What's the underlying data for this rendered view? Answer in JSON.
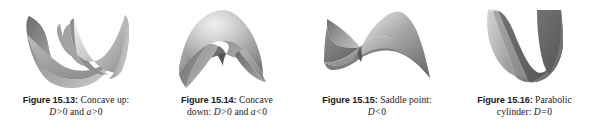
{
  "page": {
    "background_color": "#ffffff",
    "text_color": "#1c1a1b",
    "kind": "textbook-figure-strip",
    "figure_count": 4
  },
  "figures": [
    {
      "id": "figure-15-13",
      "number": "Figure 15.13:",
      "title": "Concave up:",
      "condition_text": "D > 0 and a > 0",
      "condition_parts": {
        "var1": "D",
        "op1": ">",
        "val1": "0",
        "conj": "and",
        "var2": "a",
        "op2": ">",
        "val2": "0"
      },
      "surface_name": "elliptic-paraboloid-up",
      "surface_description": "Concave up bowl (elliptic paraboloid opening upward)",
      "shading": {
        "light": "#f2f2f2",
        "mid": "#9d9d9d",
        "dark": "#6e6e6e"
      }
    },
    {
      "id": "figure-15-14",
      "number": "Figure 15.14:",
      "title": "Concave",
      "title_line2_prefix": "down:",
      "condition_text": "D > 0 and a < 0",
      "condition_parts": {
        "var1": "D",
        "op1": ">",
        "val1": "0",
        "conj": "and",
        "var2": "a",
        "op2": "<",
        "val2": "0"
      },
      "surface_name": "elliptic-paraboloid-down",
      "surface_description": "Concave down dome (elliptic paraboloid opening downward)",
      "shading": {
        "light": "#e9e9e9",
        "mid": "#9a9a9a",
        "dark": "#6b6b6b"
      }
    },
    {
      "id": "figure-15-15",
      "number": "Figure 15.15:",
      "title": "Saddle point:",
      "condition_text": "D < 0",
      "condition_parts": {
        "var1": "D",
        "op1": "<",
        "val1": "0"
      },
      "surface_name": "hyperbolic-paraboloid-saddle",
      "surface_description": "Saddle surface (hyperbolic paraboloid)",
      "shading": {
        "light": "#e6e6e6",
        "mid": "#959595",
        "dark": "#5f5f5f"
      }
    },
    {
      "id": "figure-15-16",
      "number": "Figure 15.16:",
      "title": "Parabolic",
      "title_line2_prefix": "cylinder:",
      "condition_text": "D = 0",
      "condition_parts": {
        "var1": "D",
        "op1": "=",
        "val1": "0"
      },
      "surface_name": "parabolic-cylinder",
      "surface_description": "Parabolic cylinder, V-shaped trough",
      "shading": {
        "light": "#c9c9c9",
        "mid": "#8f8f8f",
        "dark": "#636363"
      }
    }
  ]
}
